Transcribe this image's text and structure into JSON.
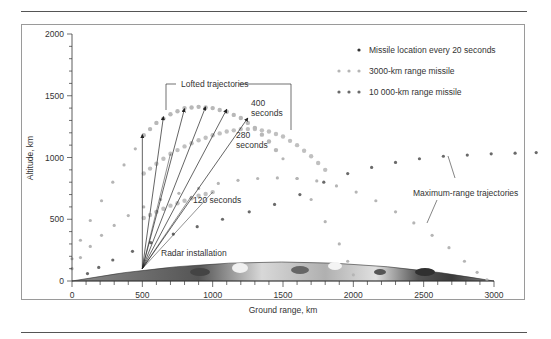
{
  "chart_data": {
    "type": "scatter",
    "title": "",
    "xlabel": "Ground range, km",
    "ylabel": "Altitude, km",
    "xlim": [
      0,
      3000
    ],
    "ylim": [
      0,
      2000
    ],
    "x_ticks": [
      0,
      500,
      1000,
      1500,
      2000,
      2500,
      3000
    ],
    "y_ticks": [
      0,
      500,
      1000,
      1500,
      2000
    ],
    "grid": false,
    "legend_position": "upper right",
    "legend": [
      {
        "label": "Missile location every 20 seconds",
        "marker": "single dark dot",
        "color": "#333333"
      },
      {
        "label": "3000-km range missile",
        "marker": "light grey dots",
        "color": "#b5b5b5"
      },
      {
        "label": "10 000-km range missile",
        "marker": "dark grey dots",
        "color": "#6a6a6a"
      }
    ],
    "series": [
      {
        "name": "3000-km range missile (maximum-range trajectory)",
        "color": "#b5b5b5",
        "x": [
          0,
          60,
          130,
          210,
          300,
          400,
          510,
          630,
          760,
          900,
          1040,
          1180,
          1320,
          1460,
          1600,
          1740,
          1880,
          2020,
          2160,
          2300,
          2430,
          2560,
          2680,
          2790,
          2880,
          2950
        ],
        "y": [
          100,
          190,
          280,
          370,
          450,
          530,
          600,
          660,
          710,
          750,
          790,
          815,
          830,
          835,
          830,
          810,
          770,
          720,
          650,
          560,
          470,
          370,
          270,
          160,
          70,
          10
        ]
      },
      {
        "name": "3000-km range missile (lofted trajectory, 400 s)",
        "color": "#b5b5b5",
        "x": [
          0,
          60,
          130,
          210,
          290,
          370,
          450,
          510,
          600,
          700,
          800,
          900,
          1000,
          1100,
          1200,
          1300,
          1400,
          1500,
          1600,
          1700,
          1800,
          1900,
          1960,
          2000
        ],
        "y": [
          180,
          330,
          490,
          650,
          800,
          940,
          1070,
          1180,
          1280,
          1350,
          1400,
          1410,
          1400,
          1370,
          1320,
          1240,
          1130,
          990,
          830,
          660,
          480,
          300,
          160,
          50
        ]
      },
      {
        "name": "3000-km range missile (lofted trajectory, 280 s)",
        "color": "#c0c0c0",
        "x": [
          510,
          600,
          700,
          800,
          900,
          1000,
          1100,
          1200,
          1300,
          1400,
          1500,
          1600,
          1700,
          1800
        ],
        "y": [
          870,
          950,
          1030,
          1090,
          1140,
          1180,
          1210,
          1230,
          1230,
          1210,
          1170,
          1100,
          1010,
          900
        ]
      },
      {
        "name": "3000-km range missile (lofted trajectory, 120 s)",
        "color": "#c0c0c0",
        "x": [
          510,
          600,
          700,
          800,
          900,
          1000
        ],
        "y": [
          510,
          560,
          610,
          650,
          690,
          720
        ]
      },
      {
        "name": "10 000-km range missile (maximum-range trajectory)",
        "color": "#6a6a6a",
        "x": [
          110,
          190,
          290,
          430,
          560,
          720,
          890,
          1070,
          1260,
          1440,
          1620,
          1790,
          1960,
          2130,
          2300,
          2470,
          2640,
          2810,
          2980,
          3150,
          3300
        ],
        "y": [
          60,
          110,
          170,
          240,
          310,
          380,
          440,
          500,
          560,
          620,
          700,
          800,
          870,
          920,
          960,
          990,
          1010,
          1020,
          1030,
          1035,
          1040
        ]
      }
    ],
    "annotations": [
      {
        "text": "Lofted trajectories",
        "x": 1000,
        "y": 1590
      },
      {
        "text": "400",
        "x": 1300,
        "y": 1420
      },
      {
        "text": "seconds",
        "x": 1300,
        "y": 1340
      },
      {
        "text": "280",
        "x": 1230,
        "y": 1160
      },
      {
        "text": "seconds",
        "x": 1230,
        "y": 1080
      },
      {
        "text": "120 seconds",
        "x": 840,
        "y": 640
      },
      {
        "text": "Radar installation",
        "x": 560,
        "y": 200
      },
      {
        "text": "Maximum-range trajectories",
        "x": 2400,
        "y": 750
      }
    ],
    "radar": {
      "x": 500,
      "y": 100,
      "arrows_to": [
        [
          500,
          1185
        ],
        [
          650,
          1330
        ],
        [
          800,
          1395
        ],
        [
          950,
          1410
        ],
        [
          1100,
          1390
        ],
        [
          1250,
          1320
        ]
      ]
    }
  },
  "labels": {
    "xlabel": "Ground range, km",
    "ylabel": "Altitude, km",
    "x_ticks": [
      "0",
      "500",
      "1000",
      "1500",
      "2000",
      "2500",
      "3000"
    ],
    "y_ticks": [
      "0",
      "500",
      "1000",
      "1500",
      "2000"
    ],
    "legend_1": "Missile location every 20 seconds",
    "legend_2": "3000-km range missile",
    "legend_3": "10 000-km range missile",
    "lofted": "Lofted trajectories",
    "t400a": "400",
    "t400b": "seconds",
    "t280a": "280",
    "t280b": "seconds",
    "t120": "120 seconds",
    "radar": "Radar installation",
    "maxrange": "Maximum-range trajectories"
  }
}
